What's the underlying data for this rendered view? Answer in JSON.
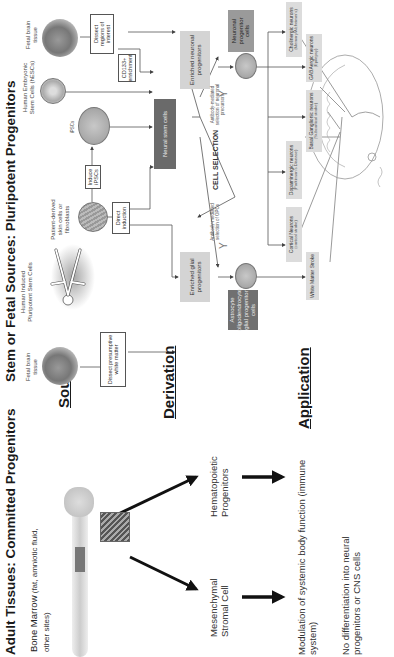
{
  "titles": {
    "adult": "Adult Tissues: Committed Progenitors",
    "stem": "Stem or Fetal Sources: Pluripotent Progenitors"
  },
  "row_headings": {
    "source": "Source",
    "derivation": "Derivation",
    "application": "Application"
  },
  "adult": {
    "source_label_main": "Bone Marrow",
    "source_label_detail": " (fat, amniotic fluid, other sites)",
    "derived": [
      {
        "label": "Mesenchymal Stromal Cell"
      },
      {
        "label": "Hematopoietic Progenitors"
      }
    ],
    "application_1": "Modulation of systemic body function (immune system)",
    "application_2": "No differentiation into neural progenitors or CNS cells"
  },
  "stem": {
    "sources": [
      {
        "label": "Fetal brain tissue",
        "icon": "fetal-brain-icon"
      },
      {
        "label": "Human Induced Pluripotent Stem Cells",
        "icon": "human-figure-icon"
      },
      {
        "label": "Human Embryonic Stem Cells (hESCs)",
        "icon": "embryonic-stem-cell-icon"
      },
      {
        "label": "Fetal brain tissue",
        "icon": "fetal-brain-icon"
      }
    ],
    "patient_cells": "Patient-derived skin cells or fibroblasts",
    "ipsc_label": "iPSCs",
    "boxes": {
      "dissect_white_matter": "Dissect presumptive white matter",
      "direct_induction": "Direct induction",
      "induce_ipscs": "Induce iPSCs",
      "dissect_regions": "Dissect regions of interest",
      "cd133": "CD133+ enrichment",
      "neural_stem_cells": "Neural stem cells",
      "enriched_glial": "Enriched glial progenitors",
      "enriched_neuronal": "Enriched neuronal progenitors",
      "glial_cells": "Astrocyte oligodendrocyte glial progenitor cells",
      "neuronal_cells": "Neuronal progenitor cells"
    },
    "cell_selection": "CELL SELECTION",
    "antibody_glial": "Antibody-mediated selection of OPCs",
    "antibody_neuronal": "Antibody-mediated selection of neuronal precursors",
    "applications": [
      {
        "name": "White Matter Stroke",
        "sub": ""
      },
      {
        "name": "Cortical Neurons",
        "sub": "(cortical stroke)"
      },
      {
        "name": "Dopaminergic neurons",
        "sub": "(Parkinson's Disease)"
      },
      {
        "name": "Basal Ganglionic neurons",
        "sub": "(Subcortical stroke)"
      },
      {
        "name": "GABAergic neurons",
        "sub": "(Epilepsy)"
      },
      {
        "name": "Cholinergic neurons",
        "sub": "(Memory/Alzheimer's)"
      }
    ]
  }
}
